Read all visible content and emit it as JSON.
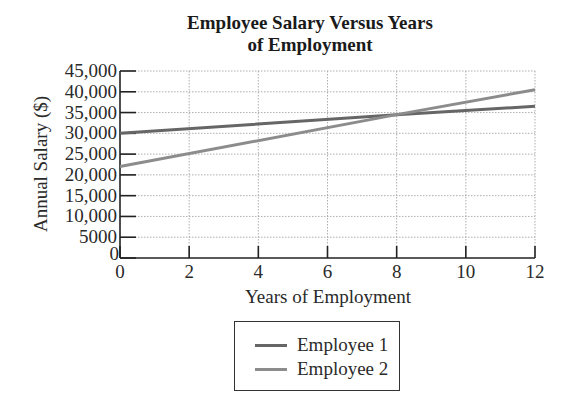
{
  "chart_data": {
    "type": "line",
    "title": "Employee Salary Versus Years of Employment",
    "title_lines": [
      "Employee Salary Versus Years",
      "of Employment"
    ],
    "xlabel": "Years of Employment",
    "ylabel": "Annual Salary ($)",
    "xlim": [
      0,
      12
    ],
    "ylim": [
      0,
      45000
    ],
    "x_ticks": [
      0,
      2,
      4,
      6,
      8,
      10,
      12
    ],
    "x_tick_labels": [
      "0",
      "2",
      "4",
      "6",
      "8",
      "10",
      "12"
    ],
    "y_ticks": [
      0,
      5000,
      10000,
      15000,
      20000,
      25000,
      30000,
      35000,
      40000,
      45000
    ],
    "y_tick_labels": [
      "0",
      "5000",
      "10,000",
      "15,000",
      "20,000",
      "25,000",
      "30,000",
      "35,000",
      "40,000",
      "45,000"
    ],
    "grid": true,
    "legend_position": "below",
    "series": [
      {
        "name": "Employee 1",
        "color": "#666666",
        "x": [
          0,
          8,
          12
        ],
        "values": [
          30000,
          34500,
          36500
        ]
      },
      {
        "name": "Employee 2",
        "color": "#8c8c8c",
        "x": [
          0,
          8,
          12
        ],
        "values": [
          22000,
          34500,
          40500
        ]
      }
    ]
  },
  "legend": {
    "items": [
      {
        "label": "Employee 1",
        "color": "#666666"
      },
      {
        "label": "Employee 2",
        "color": "#8c8c8c"
      }
    ]
  }
}
